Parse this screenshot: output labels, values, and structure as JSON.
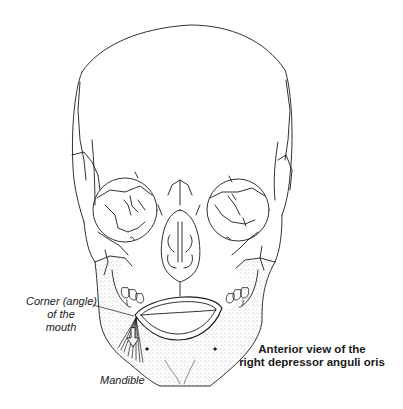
{
  "figure": {
    "title": "Anterior view of the right depressor anguli oris",
    "caption_lines": [
      "Anterior view of the",
      "right depressor anguli oris"
    ],
    "colors": {
      "line": "#1a1a1a",
      "stipple": "#555555",
      "background": "#ffffff"
    }
  },
  "labels": {
    "corner_of_mouth": {
      "lines": [
        "Corner (angle)",
        "of the",
        "mouth"
      ]
    },
    "mandible": "Mandible"
  }
}
